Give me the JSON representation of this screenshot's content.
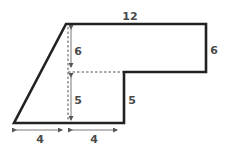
{
  "figure": {
    "colors": {
      "outline": "#222222",
      "dashed": "#555555",
      "arrow": "#555555",
      "label": "#4a4a4a",
      "background": "#ffffff"
    },
    "labels": {
      "top_width": "12",
      "right_height": "6",
      "upper_inner_height": "6",
      "lower_inner_height": "5",
      "notch_height": "5",
      "bottom_left_width": "4",
      "bottom_right_width": "4"
    }
  }
}
